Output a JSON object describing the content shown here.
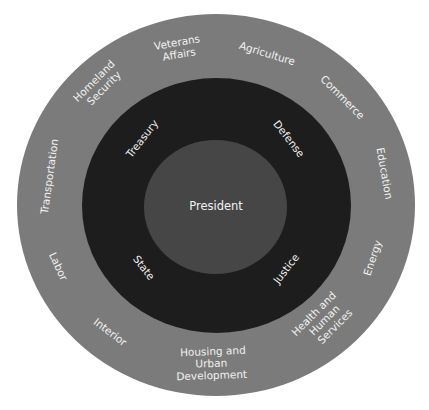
{
  "diagram": {
    "title": "",
    "colors": {
      "background": "#ffffff",
      "outer_ring": "#7b7b7b",
      "middle_ring": "#1d1d1d",
      "center": "#464646",
      "text": "#f2f2f2"
    },
    "center": {
      "label": "President"
    },
    "inner_ring": {
      "labels": [
        "Treasury",
        "Defense",
        "State",
        "Justice"
      ]
    },
    "outer_ring": {
      "labels": [
        "Veterans Affairs",
        "Agriculture",
        "Commerce",
        "Education",
        "Energy",
        "Health and Human Services",
        "Housing and Urban Development",
        "Interior",
        "Labor",
        "Transportation",
        "Homeland Security"
      ],
      "lines": {
        "veterans": [
          "Veterans",
          "Affairs"
        ],
        "agriculture": [
          "Agriculture"
        ],
        "commerce": [
          "Commerce"
        ],
        "education": [
          "Education"
        ],
        "energy": [
          "Energy"
        ],
        "hhs": [
          "Health and",
          "Human",
          "Services"
        ],
        "hud": [
          "Housing and",
          "Urban",
          "Development"
        ],
        "interior": [
          "Interior"
        ],
        "labor": [
          "Labor"
        ],
        "transportation": [
          "Transportation"
        ],
        "homeland": [
          "Homeland",
          "Security"
        ]
      }
    }
  }
}
